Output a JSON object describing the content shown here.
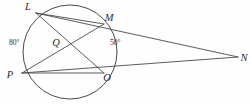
{
  "figure": {
    "kind": "circle-geometry-diagram",
    "background_color": "#fefefe",
    "stroke_color": "#4a4a4a",
    "label_color": "#2b2b2b",
    "circle": {
      "cx": 70,
      "cy": 52,
      "r": 47
    },
    "points": [
      {
        "id": "L",
        "label": "L",
        "x": 36,
        "y": 13,
        "label_x": 28,
        "label_y": 10
      },
      {
        "id": "M",
        "label": "M",
        "x": 104,
        "y": 24,
        "label_x": 106,
        "label_y": 21
      },
      {
        "id": "Q",
        "label": "Q",
        "x": 60,
        "y": 43,
        "label_x": 55,
        "label_y": 46
      },
      {
        "id": "P",
        "label": "P",
        "x": 22,
        "y": 73,
        "label_x": 8,
        "label_y": 77
      },
      {
        "id": "O",
        "label": "O",
        "x": 104,
        "y": 73,
        "label_x": 105,
        "label_y": 80
      },
      {
        "id": "N",
        "label": "N",
        "x": 238,
        "y": 57,
        "label_x": 241,
        "label_y": 61
      }
    ],
    "segments": [
      {
        "id": "chord-LM",
        "from": "L",
        "to": "M"
      },
      {
        "id": "chord-LO",
        "from": "L",
        "to": "O"
      },
      {
        "id": "chord-PM",
        "from": "P",
        "to": "M"
      },
      {
        "id": "chord-PO",
        "from": "P",
        "to": "O"
      },
      {
        "id": "secant-LN",
        "from": "L",
        "to": "N"
      },
      {
        "id": "secant-PN",
        "from": "P",
        "to": "N"
      }
    ],
    "angles": [
      {
        "id": "arc-LP",
        "value": "80°",
        "x": 9,
        "y": 44
      },
      {
        "id": "angle-MQO",
        "value": "50°",
        "x": 110,
        "y": 44
      }
    ]
  }
}
